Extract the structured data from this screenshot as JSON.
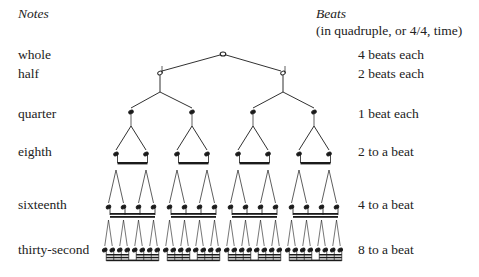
{
  "headers": {
    "notes": "Notes",
    "beats": "Beats",
    "beats_sub": "(in quadruple, or 4/4, time)"
  },
  "rows": [
    {
      "note": "whole",
      "beats": "4 beats each",
      "y": 22
    },
    {
      "note": "half",
      "beats": "2 beats each",
      "y": 42
    },
    {
      "note": "quarter",
      "beats": "1 beat each",
      "y": 108
    },
    {
      "note": "eighth",
      "beats": "2 to a beat",
      "y": 145
    },
    {
      "note": "sixteenth",
      "beats": "4 to a beat",
      "y": 201
    },
    {
      "note": "thirty-second",
      "beats": "8 to a beat",
      "y": 241
    }
  ],
  "tree": {
    "whole": {
      "x": 223,
      "y": 54
    },
    "half": [
      160,
      283
    ],
    "quarter": [
      131,
      192,
      253,
      314
    ],
    "levels_y": {
      "whole": 54,
      "half": 73,
      "quarter": 112,
      "eighth": 154,
      "sixteenth": 207,
      "thirtysecond": 250
    },
    "color": "#1a1a1a"
  }
}
